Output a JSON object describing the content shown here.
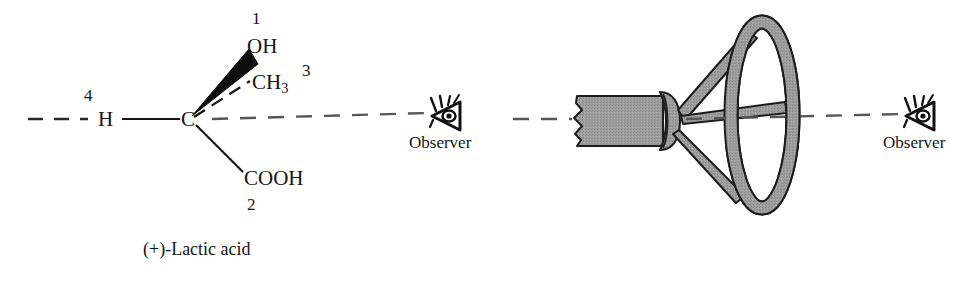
{
  "figure": {
    "background_color": "#ffffff",
    "ink_color": "#141414",
    "wheel_fill_color": "#9a9a9a",
    "wheel_outline_color": "#1a1a1a",
    "width": 967,
    "height": 290
  },
  "left_panel": {
    "caption": "(+)-Lactic acid",
    "central_atom": "C",
    "observer_label": "Observer",
    "bonds": [
      {
        "substituent": "H",
        "priority": "4",
        "style": "plain-line",
        "direction": "left",
        "note": "bond pointing away from observer, along the view axis"
      },
      {
        "substituent": "OH",
        "priority": "1",
        "style": "solid-wedge",
        "direction": "upper-right",
        "note": "wedge: toward the viewer"
      },
      {
        "substituent": "CH3",
        "substituent_main": "CH",
        "substituent_sub": "3",
        "priority": "3",
        "style": "dashed-wedge",
        "direction": "right-upper",
        "note": "hashed: behind the plane"
      },
      {
        "substituent": "COOH",
        "priority": "2",
        "style": "plain-line",
        "direction": "lower-right",
        "note": "in the plane of the paper"
      }
    ],
    "view_axis": {
      "style": "dashed",
      "label": "line of sight from C to Observer"
    }
  },
  "right_panel": {
    "observer_label": "Observer",
    "object": "steering-wheel",
    "parts": [
      {
        "name": "steering-column",
        "shape": "cylindrical shaft with broken-off left end"
      },
      {
        "name": "hub",
        "shape": "collar / boss at the end of the column"
      },
      {
        "name": "spokes",
        "count": 3
      },
      {
        "name": "rim",
        "shape": "ellipse seen obliquely"
      }
    ],
    "view_axis": {
      "style": "dashed"
    }
  },
  "icons": {
    "eye": "eye-icon",
    "eye_description": "profile eye with lashes, pointing right toward the viewer"
  }
}
